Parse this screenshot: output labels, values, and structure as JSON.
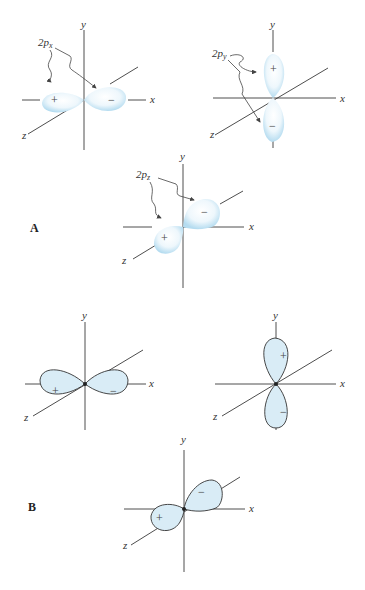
{
  "panels": {
    "A": {
      "label": "A"
    },
    "B": {
      "label": "B"
    }
  },
  "axes": {
    "x": "x",
    "y": "y",
    "z": "z"
  },
  "orbitals": {
    "px": {
      "name": "2p",
      "sub": "x",
      "plus": "+",
      "minus": "−"
    },
    "py": {
      "name": "2p",
      "sub": "y",
      "plus": "+",
      "minus": "−"
    },
    "pz": {
      "name": "2p",
      "sub": "z",
      "plus": "+",
      "minus": "−"
    }
  },
  "colors": {
    "lobe_fill": "#d9ecf6",
    "cloud": "#bfe0f3",
    "axis": "#3a3a3a"
  }
}
